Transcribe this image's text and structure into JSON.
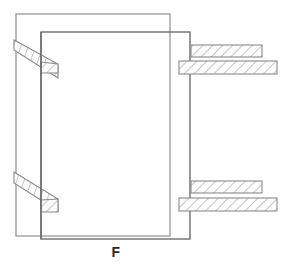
{
  "figure": {
    "caption": "F",
    "background_color": "#ffffff",
    "line_color": "#8a8a8a",
    "outline_color": "#6e6e6e",
    "hatch_color": "#9a9a9a",
    "caption_color": "#2b2b2b",
    "hatch_fill": "#fdfdfd",
    "view_width": 293,
    "view_height": 264
  },
  "shapes": {
    "back_plate": {
      "name": "back-plate-outline",
      "x": 16,
      "y": 14,
      "width": 154,
      "height": 222
    },
    "front_plate": {
      "name": "front-plate-outline",
      "x": 41,
      "y": 32,
      "width": 149,
      "height": 207
    }
  },
  "hatched_bands": [
    {
      "name": "upper-left-diagonal-band",
      "points": "14,40 14,50 58,78 58,64",
      "orientation": "diagonal-down-right"
    },
    {
      "name": "upper-left-stub-band",
      "points": "41,62 41,73 58,73 58,64",
      "orientation": "horizontal-stub"
    },
    {
      "name": "lower-left-diagonal-band",
      "points": "14,172 14,183 58,211 58,199",
      "orientation": "diagonal-down-right"
    },
    {
      "name": "lower-left-stub-band",
      "points": "41,200 41,212 58,212 58,199",
      "orientation": "horizontal-stub"
    }
  ],
  "hatched_bars": [
    {
      "name": "upper-right-inner-bar",
      "x": 191,
      "y": 45,
      "width": 71,
      "height": 12
    },
    {
      "name": "upper-right-outer-bar",
      "x": 179,
      "y": 61,
      "width": 98,
      "height": 13
    },
    {
      "name": "lower-right-inner-bar",
      "x": 191,
      "y": 181,
      "width": 71,
      "height": 12
    },
    {
      "name": "lower-right-outer-bar",
      "x": 179,
      "y": 198,
      "width": 98,
      "height": 13
    }
  ]
}
